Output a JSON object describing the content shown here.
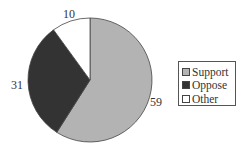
{
  "chart_data": {
    "type": "pie",
    "title": "",
    "categories": [
      "Support",
      "Oppose",
      "Other"
    ],
    "values": [
      59,
      31,
      10
    ],
    "colors": [
      "#b3b3b3",
      "#333333",
      "#ffffff"
    ],
    "start_angle": "12 o'clock, clockwise",
    "data_labels": [
      "59",
      "31",
      "10"
    ],
    "legend": {
      "position": "right",
      "entries": [
        "Support",
        "Oppose",
        "Other"
      ]
    }
  }
}
